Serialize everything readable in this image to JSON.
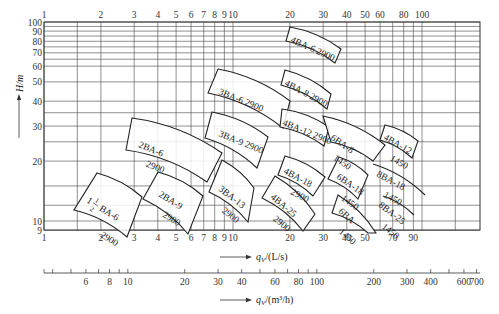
{
  "chart_data": {
    "type": "line",
    "title": "",
    "subtitle": "BA-series centrifugal pump selection chart (log-log)",
    "xlabel": "q_V/(L/s)",
    "xlabel_secondary": "q_V/(m³/h)",
    "ylabel": "H/m",
    "xscale": "log",
    "yscale": "log",
    "xlim": [
      1,
      190
    ],
    "ylim": [
      9,
      100
    ],
    "grid": true,
    "x_ticks_top": [
      "1",
      "2",
      "3",
      "4",
      "5",
      "6",
      "7",
      "8",
      "9",
      "10",
      "20",
      "30",
      "40",
      "50",
      "60",
      "80",
      "100"
    ],
    "x_ticks_top_values": [
      1,
      2,
      3,
      4,
      5,
      6,
      7,
      8,
      9,
      10,
      20,
      30,
      40,
      50,
      60,
      80,
      100
    ],
    "x_ticks_bottom": [
      "1",
      "2",
      "3",
      "4",
      "5",
      "6",
      "7",
      "8",
      "9",
      "10",
      "20",
      "30",
      "40",
      "50",
      "70",
      "90"
    ],
    "x_ticks_bottom_values": [
      1,
      2,
      3,
      4,
      5,
      6,
      7,
      8,
      9,
      10,
      20,
      30,
      40,
      50,
      70,
      90
    ],
    "y_ticks": [
      "9",
      "10",
      "20",
      "30",
      "40",
      "50",
      "60",
      "70",
      "80",
      "90",
      "100"
    ],
    "y_ticks_values": [
      9,
      10,
      20,
      30,
      40,
      50,
      60,
      70,
      80,
      90,
      100
    ],
    "secondary_axis_ticks": [
      "6",
      "8",
      "10",
      "20",
      "30",
      "40",
      "60",
      "80",
      "100",
      "200",
      "300",
      "400",
      "600",
      "700"
    ],
    "secondary_axis_values": [
      6,
      8,
      10,
      20,
      30,
      40,
      60,
      80,
      100,
      200,
      300,
      400,
      600,
      700
    ],
    "series": [
      {
        "name": "1½BA-6",
        "model": "1½BA-6",
        "speed": "2900",
        "q_range": [
          1.5,
          3.0
        ],
        "H_range": [
          10.0,
          16.5
        ],
        "label_html": "BA-6",
        "fraction": "1/2",
        "whole": "1"
      },
      {
        "name": "2BA-9",
        "model": "2BA-9",
        "speed": "2900",
        "q_range": [
          3.0,
          6.2
        ],
        "H_range": [
          10.0,
          17.5
        ]
      },
      {
        "name": "2BA-6",
        "model": "2BA-6",
        "speed": "2900",
        "q_range": [
          2.9,
          7.6
        ],
        "H_range": [
          19.0,
          31.5
        ]
      },
      {
        "name": "3BA-13",
        "model": "3BA-13",
        "speed": "2900",
        "q_range": [
          6.2,
          12.5
        ],
        "H_range": [
          10.0,
          17.0
        ]
      },
      {
        "name": "3BA-9",
        "model": "3BA-9",
        "speed": "2900",
        "q_range": [
          7.2,
          15.0
        ],
        "H_range": [
          19.0,
          32.0
        ]
      },
      {
        "name": "3BA-6",
        "model": "3BA-6",
        "speed": "2900",
        "q_range": [
          8.0,
          19.0
        ],
        "H_range": [
          36.0,
          56.0
        ]
      },
      {
        "name": "4BA-25",
        "model": "4BA-25",
        "speed": "2900",
        "q_range": [
          15.0,
          28.0
        ],
        "H_range": [
          9.5,
          16.0
        ]
      },
      {
        "name": "4BA-18",
        "model": "4BA-18",
        "speed": "2900",
        "q_range": [
          18.0,
          30.0
        ],
        "H_range": [
          14.0,
          18.5
        ]
      },
      {
        "name": "4BA-12",
        "model": "4BA-12",
        "speed": "2900",
        "q_range": [
          19.0,
          34.0
        ],
        "H_range": [
          26.0,
          34.0
        ]
      },
      {
        "name": "4BA-8",
        "model": "4BA-8",
        "speed": "2900",
        "q_range": [
          19.0,
          35.0
        ],
        "H_range": [
          37.0,
          48.0
        ]
      },
      {
        "name": "4BA-6",
        "model": "4BA-6",
        "speed": "2900",
        "q_range": [
          18.0,
          30.0
        ],
        "H_range": [
          71.0,
          93.0
        ]
      },
      {
        "name": "6BA",
        "model": "6BA",
        "speed": "1450",
        "q_range": [
          28.0,
          55.0
        ],
        "H_range": [
          9.5,
          13.5
        ]
      },
      {
        "name": "6BA-18",
        "model": "6BA-18",
        "speed": "1450",
        "q_range": [
          31.0,
          53.0
        ],
        "H_range": [
          14.0,
          20.5
        ]
      },
      {
        "name": "6BA-8",
        "model": "6BA-8",
        "speed": "1450",
        "q_range": [
          31.0,
          60.0
        ],
        "H_range": [
          21.0,
          32.0
        ]
      },
      {
        "name": "8BA-25",
        "model": "8BA-25",
        "speed": "1450",
        "q_range": [
          55.0,
          90.0
        ],
        "H_range": [
          11.5,
          16.0
        ]
      },
      {
        "name": "8BA-18",
        "model": "8BA-18",
        "speed": "1450",
        "q_range": [
          55.0,
          97.0
        ],
        "H_range": [
          14.5,
          21.0
        ]
      },
      {
        "name": "4BA-12",
        "model": "4BA-12",
        "speed": "1450",
        "q_range": [
          63.0,
          92.0
        ],
        "H_range": [
          22.0,
          26.0
        ],
        "note": "label reads 4BA-12 1450"
      }
    ]
  },
  "axes": {
    "y_label": "H/m",
    "x_label_primary": "q",
    "x_label_primary_sub": "V",
    "x_label_primary_unit": "/(L/s)",
    "x_label_secondary": "q",
    "x_label_secondary_sub": "V",
    "x_label_secondary_unit": "/(m³/h)"
  }
}
